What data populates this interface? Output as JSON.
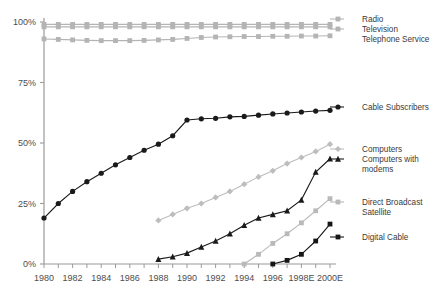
{
  "chart_data": {
    "type": "line",
    "title": "",
    "subtitle": "",
    "xlabel": "",
    "ylabel": "",
    "x": [
      1980,
      1981,
      1982,
      1983,
      1984,
      1985,
      1986,
      1987,
      1988,
      1989,
      1990,
      1991,
      1992,
      1993,
      1994,
      1995,
      1996,
      1997,
      1998,
      1999,
      2000
    ],
    "xtick_values": [
      1980,
      1982,
      1984,
      1986,
      1988,
      1990,
      1992,
      1994,
      1996,
      1998,
      2000
    ],
    "xtick_labels": [
      "1980",
      "1982",
      "1984",
      "1986",
      "1988",
      "1990",
      "1992",
      "1994",
      "1996",
      "1998E",
      "2000E"
    ],
    "ytick_values": [
      0,
      25,
      50,
      75,
      100
    ],
    "ytick_labels": [
      "0%",
      "25%",
      "50%",
      "75%",
      "100%"
    ],
    "ylim": [
      0,
      100
    ],
    "xlim": [
      1980,
      2000
    ],
    "grid": false,
    "legend_position": "right",
    "series": [
      {
        "name": "Radio",
        "color": "#b4b4b4",
        "marker": "square",
        "x": [
          1980,
          1981,
          1982,
          1983,
          1984,
          1985,
          1986,
          1987,
          1988,
          1989,
          1990,
          1991,
          1992,
          1993,
          1994,
          1995,
          1996,
          1997,
          1998,
          1999,
          2000
        ],
        "values": [
          99.0,
          99.0,
          99.0,
          99.0,
          99.0,
          99.0,
          99.0,
          99.0,
          99.0,
          99.0,
          99.0,
          99.0,
          99.0,
          99.0,
          99.0,
          99.0,
          99.0,
          99.0,
          99.0,
          99.0,
          99.0
        ]
      },
      {
        "name": "Television",
        "color": "#b4b4b4",
        "marker": "square",
        "x": [
          1980,
          1981,
          1982,
          1983,
          1984,
          1985,
          1986,
          1987,
          1988,
          1989,
          1990,
          1991,
          1992,
          1993,
          1994,
          1995,
          1996,
          1997,
          1998,
          1999,
          2000
        ],
        "values": [
          98.0,
          98.0,
          98.0,
          98.0,
          98.0,
          98.0,
          98.0,
          98.0,
          98.0,
          98.0,
          98.0,
          98.0,
          98.0,
          98.0,
          98.0,
          98.0,
          98.0,
          98.0,
          98.0,
          98.0,
          98.0
        ]
      },
      {
        "name": "Telephone Service",
        "color": "#b4b4b4",
        "marker": "square",
        "x": [
          1980,
          1981,
          1982,
          1983,
          1984,
          1985,
          1986,
          1987,
          1988,
          1989,
          1990,
          1991,
          1992,
          1993,
          1994,
          1995,
          1996,
          1997,
          1998,
          1999,
          2000
        ],
        "values": [
          93.0,
          92.8,
          92.6,
          92.4,
          92.3,
          92.3,
          92.3,
          92.4,
          92.6,
          92.8,
          93.2,
          93.6,
          93.8,
          93.9,
          94.0,
          94.0,
          94.1,
          94.1,
          94.2,
          94.2,
          94.3
        ]
      },
      {
        "name": "Cable Subscribers",
        "color": "#1a1a1a",
        "marker": "circle",
        "x": [
          1980,
          1981,
          1982,
          1983,
          1984,
          1985,
          1986,
          1987,
          1988,
          1989,
          1990,
          1991,
          1992,
          1993,
          1994,
          1995,
          1996,
          1997,
          1998,
          1999,
          2000
        ],
        "values": [
          19.0,
          25.0,
          30.0,
          34.0,
          37.5,
          41.0,
          44.0,
          47.0,
          49.5,
          53.0,
          59.5,
          60.0,
          60.2,
          60.8,
          61.0,
          61.5,
          62.0,
          62.4,
          62.8,
          63.2,
          63.5
        ]
      },
      {
        "name": "Computers",
        "color": "#bdbdbd",
        "marker": "diamond",
        "x": [
          1988,
          1989,
          1990,
          1991,
          1992,
          1993,
          1994,
          1995,
          1996,
          1997,
          1998,
          1999,
          2000
        ],
        "values": [
          18.0,
          20.5,
          23.0,
          25.0,
          27.5,
          30.0,
          33.0,
          36.0,
          38.5,
          41.5,
          44.0,
          46.5,
          49.5
        ]
      },
      {
        "name": "Computers with modems",
        "color": "#1a1a1a",
        "marker": "triangle",
        "x": [
          1988,
          1989,
          1990,
          1991,
          1992,
          1993,
          1994,
          1995,
          1996,
          1997,
          1998,
          1999,
          2000
        ],
        "values": [
          2.0,
          3.0,
          4.5,
          7.0,
          9.5,
          12.5,
          16.0,
          19.0,
          20.5,
          22.0,
          26.5,
          38.0,
          43.5
        ]
      },
      {
        "name": "Direct Broadcast Satellite",
        "color": "#b9b9b9",
        "marker": "square",
        "x": [
          1994,
          1995,
          1996,
          1997,
          1998,
          1999,
          2000
        ],
        "values": [
          0.0,
          4.0,
          8.5,
          12.5,
          17.0,
          22.0,
          27.0
        ]
      },
      {
        "name": "Digital Cable",
        "color": "#161616",
        "marker": "square",
        "x": [
          1996,
          1997,
          1998,
          1999,
          2000
        ],
        "values": [
          0.0,
          1.5,
          4.0,
          9.5,
          16.5
        ]
      }
    ],
    "legend_entries": [
      {
        "label": "Radio",
        "marker": "square",
        "color": "#b4b4b4"
      },
      {
        "label": "Television",
        "marker": "square",
        "color": "#b4b4b4"
      },
      {
        "label": "Telephone Service",
        "marker": "none",
        "color": "#b4b4b4"
      },
      {
        "label": "Cable Subscribers",
        "marker": "circle",
        "color": "#1a1a1a"
      },
      {
        "label": "Computers",
        "marker": "diamond",
        "color": "#bdbdbd"
      },
      {
        "label": "Computers with",
        "marker": "triangle",
        "color": "#1a1a1a"
      },
      {
        "label": "modems",
        "marker": "none",
        "color": "#1a1a1a"
      },
      {
        "label": "Direct Broadcast",
        "marker": "square",
        "color": "#b9b9b9"
      },
      {
        "label": "Satellite",
        "marker": "none",
        "color": "#b9b9b9"
      },
      {
        "label": "Digital Cable",
        "marker": "square",
        "color": "#161616"
      }
    ],
    "axis_color": "#9a9a9a",
    "background": "#ffffff"
  }
}
